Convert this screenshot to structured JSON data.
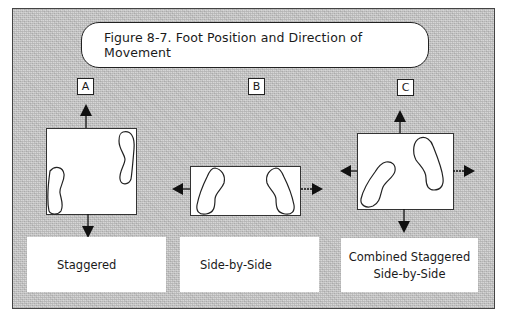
{
  "figure": {
    "title": "Figure 8-7. Foot Position and Direction of Movement"
  },
  "panels": [
    {
      "id": "A",
      "label": "A",
      "caption_lines": [
        "Staggered"
      ],
      "arrows": [
        "up",
        "down"
      ]
    },
    {
      "id": "B",
      "label": "B",
      "caption_lines": [
        "Side-by-Side"
      ],
      "arrows": [
        "left",
        "right"
      ]
    },
    {
      "id": "C",
      "label": "C",
      "caption_lines": [
        "Combined Staggered",
        "Side-by-Side"
      ],
      "arrows": [
        "up",
        "down",
        "left",
        "right"
      ]
    }
  ],
  "colors": {
    "background_pattern": "#c9c9c9",
    "panel_fill": "#ffffff",
    "ink": "#1a1a1a"
  }
}
